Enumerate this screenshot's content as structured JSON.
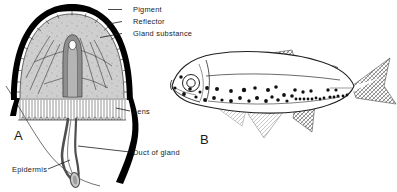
{
  "figure": {
    "background_color": "#ffffff",
    "ink_color": "#1a1a1a",
    "width": 397,
    "height": 192
  },
  "panel_a": {
    "letter": "A",
    "subject": "photophore-cross-section",
    "labels": [
      {
        "id": "pigment",
        "text": "Pigment",
        "x": 133,
        "y": 12,
        "leader_from_x": 122,
        "leader_from_y": 9.5,
        "leader_to_x": 108,
        "leader_to_y": 9.5
      },
      {
        "id": "reflector",
        "text": "Reflector",
        "x": 133,
        "y": 24,
        "leader_from_x": 122,
        "leader_from_y": 21.5,
        "leader_to_x": 106,
        "leader_to_y": 24.5
      },
      {
        "id": "gland_substance",
        "text": "Gland substance",
        "x": 133,
        "y": 36,
        "leader_from_x": 122,
        "leader_from_y": 33.5,
        "leader_to_x": 100,
        "leader_to_y": 37.5
      },
      {
        "id": "lens",
        "text": "Lens",
        "x": 133,
        "y": 114,
        "leader_from_x": 130,
        "leader_from_y": 111,
        "leader_to_x": 116,
        "leader_to_y": 108
      },
      {
        "id": "duct_of_gland",
        "text": "Duct of gland",
        "x": 133,
        "y": 155,
        "leader_from_x": 130,
        "leader_from_y": 152,
        "leader_to_x": 78,
        "leader_to_y": 146
      },
      {
        "id": "epidermis",
        "text": "Epidermis",
        "x": 12,
        "y": 172,
        "leader_from_x": 48,
        "leader_from_y": 169,
        "leader_to_x": 70,
        "leader_to_y": 160
      }
    ],
    "structures": {
      "pigment_cap": "thick black cap over dome",
      "reflector_layer": "segmented cell band beneath pigment",
      "gland_substance": "grey granular dome interior",
      "central_tube": "vertical duct with white lumen at apex",
      "lens_layer": "columnar palisade band below gland",
      "duct": "long tube curving down to bulbous end",
      "epidermis": "body surface contour line"
    },
    "letter_x": 14,
    "letter_y": 140
  },
  "panel_b": {
    "letter": "B",
    "subject": "lanternfish-with-photophores",
    "letter_x": 200,
    "letter_y": 144,
    "fins": [
      {
        "id": "dorsal-fin",
        "shading": "cross-hatch"
      },
      {
        "id": "adipose-fin",
        "shading": "outline"
      },
      {
        "id": "caudal-fin",
        "shading": "cross-hatch"
      },
      {
        "id": "anal-fin",
        "shading": "cross-hatch"
      },
      {
        "id": "pelvic-fin",
        "shading": "light-hatch"
      },
      {
        "id": "pectoral-fin",
        "shading": "light-hatch"
      }
    ],
    "eye": {
      "cx": 191,
      "cy": 83,
      "r_outer": 8.5,
      "r_inner": 4.2
    },
    "photophores": [
      {
        "x": 181,
        "y": 77,
        "r": 1.7
      },
      {
        "x": 184,
        "y": 94,
        "r": 1.9
      },
      {
        "x": 196,
        "y": 97,
        "r": 1.6
      },
      {
        "x": 205,
        "y": 100,
        "r": 1.9
      },
      {
        "x": 214,
        "y": 98,
        "r": 1.9
      },
      {
        "x": 222,
        "y": 100,
        "r": 1.6
      },
      {
        "x": 207,
        "y": 88,
        "r": 1.9
      },
      {
        "x": 217,
        "y": 89,
        "r": 2.0
      },
      {
        "x": 231,
        "y": 101,
        "r": 1.9
      },
      {
        "x": 240,
        "y": 98,
        "r": 1.9
      },
      {
        "x": 249,
        "y": 101,
        "r": 1.7
      },
      {
        "x": 257,
        "y": 98,
        "r": 2.0
      },
      {
        "x": 244,
        "y": 90,
        "r": 2.2
      },
      {
        "x": 255,
        "y": 88,
        "r": 1.8
      },
      {
        "x": 266,
        "y": 101,
        "r": 1.9
      },
      {
        "x": 272,
        "y": 97,
        "r": 1.7
      },
      {
        "x": 278,
        "y": 100,
        "r": 1.8
      },
      {
        "x": 268,
        "y": 90,
        "r": 2.0
      },
      {
        "x": 276,
        "y": 87,
        "r": 1.8
      },
      {
        "x": 284,
        "y": 95,
        "r": 1.9
      },
      {
        "x": 287,
        "y": 101,
        "r": 1.6
      },
      {
        "x": 292,
        "y": 96,
        "r": 1.8
      },
      {
        "x": 296,
        "y": 99,
        "r": 1.4
      },
      {
        "x": 300,
        "y": 99,
        "r": 1.4
      },
      {
        "x": 304,
        "y": 99,
        "r": 1.4
      },
      {
        "x": 295,
        "y": 90,
        "r": 1.8
      },
      {
        "x": 303,
        "y": 92,
        "r": 1.7
      },
      {
        "x": 308,
        "y": 99,
        "r": 1.4
      },
      {
        "x": 312,
        "y": 99,
        "r": 1.4
      },
      {
        "x": 316,
        "y": 98,
        "r": 1.4
      },
      {
        "x": 311,
        "y": 91,
        "r": 1.7
      },
      {
        "x": 320,
        "y": 99,
        "r": 1.4
      },
      {
        "x": 324,
        "y": 98,
        "r": 1.4
      },
      {
        "x": 330,
        "y": 97,
        "r": 1.6
      },
      {
        "x": 334,
        "y": 97,
        "r": 1.4
      },
      {
        "x": 338,
        "y": 96,
        "r": 1.5
      },
      {
        "x": 328,
        "y": 90,
        "r": 1.7
      },
      {
        "x": 336,
        "y": 90,
        "r": 1.6
      },
      {
        "x": 343,
        "y": 96,
        "r": 1.4
      },
      {
        "x": 347,
        "y": 95,
        "r": 1.4
      },
      {
        "x": 231,
        "y": 91,
        "r": 1.9
      },
      {
        "x": 190,
        "y": 89,
        "r": 1.8
      },
      {
        "x": 200,
        "y": 92,
        "r": 1.5
      },
      {
        "x": 175,
        "y": 88,
        "r": 1.5
      }
    ]
  }
}
